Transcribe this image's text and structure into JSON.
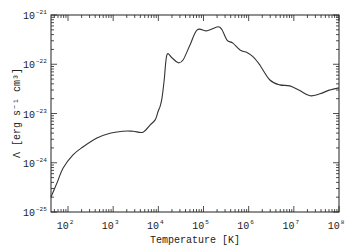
{
  "chart_data": {
    "type": "line",
    "title": "",
    "xlabel": "Temperature [K]",
    "ylabel": "Λ [erg s⁻¹ cm³]",
    "xscale": "log",
    "yscale": "log",
    "xlim": [
      42,
      100000000
    ],
    "ylim": [
      1e-25,
      1e-21
    ],
    "grid": false,
    "legend": null,
    "x_ticks": [
      {
        "value": 100,
        "base": "10",
        "exp": "2"
      },
      {
        "value": 1000,
        "base": "10",
        "exp": "3"
      },
      {
        "value": 10000,
        "base": "10",
        "exp": "4"
      },
      {
        "value": 100000,
        "base": "10",
        "exp": "5"
      },
      {
        "value": 1000000,
        "base": "10",
        "exp": "6"
      },
      {
        "value": 10000000,
        "base": "10",
        "exp": "7"
      },
      {
        "value": 100000000,
        "base": "10",
        "exp": "8"
      }
    ],
    "y_ticks": [
      {
        "value": 1e-21,
        "base": "10",
        "exp": "−21"
      },
      {
        "value": 1e-22,
        "base": "10",
        "exp": "−22"
      },
      {
        "value": 1e-23,
        "base": "10",
        "exp": "−23"
      },
      {
        "value": 1e-24,
        "base": "10",
        "exp": "−24"
      },
      {
        "value": 1e-25,
        "base": "10",
        "exp": "−25"
      }
    ],
    "series": [
      {
        "name": "Cooling function",
        "color": "#333333",
        "log10_x": [
          1.62,
          1.76,
          1.89,
          2.11,
          2.33,
          2.64,
          2.93,
          3.22,
          3.44,
          3.66,
          3.82,
          3.93,
          3.99,
          4.04,
          4.08,
          4.13,
          4.19,
          4.3,
          4.44,
          4.55,
          4.7,
          4.86,
          5.08,
          5.32,
          5.41,
          5.52,
          5.65,
          5.81,
          5.98,
          6.1,
          6.25,
          6.47,
          6.69,
          6.91,
          7.14,
          7.36,
          7.58,
          7.8,
          8.0
        ],
        "log10_y": [
          -24.7,
          -24.4,
          -24.11,
          -23.84,
          -23.68,
          -23.5,
          -23.4,
          -23.36,
          -23.36,
          -23.38,
          -23.23,
          -23.13,
          -22.97,
          -22.85,
          -22.69,
          -22.32,
          -21.81,
          -21.87,
          -21.97,
          -21.91,
          -21.61,
          -21.3,
          -21.32,
          -21.24,
          -21.3,
          -21.51,
          -21.57,
          -21.71,
          -21.77,
          -21.85,
          -22.02,
          -22.32,
          -22.42,
          -22.44,
          -22.54,
          -22.64,
          -22.6,
          -22.52,
          -22.48
        ]
      }
    ]
  }
}
